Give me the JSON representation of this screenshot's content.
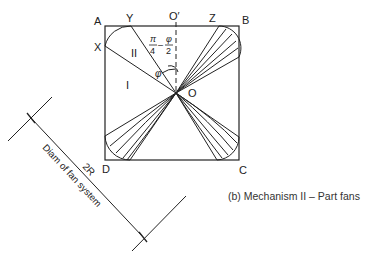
{
  "diagram": {
    "type": "mechanism-sketch",
    "caption": "(b) Mechanism II – Part fans",
    "vertices": {
      "A": "A",
      "B": "B",
      "C": "C",
      "D": "D",
      "X": "X",
      "Y": "Y",
      "Z": "Z",
      "O": "O",
      "O_prime": "O′"
    },
    "regions": {
      "region_1": "I",
      "region_2": "II"
    },
    "angles": {
      "phi": "φ",
      "pi_over_4": "π",
      "pi_over_4_den": "4",
      "minus": "–",
      "phi_over_2": "φ",
      "phi_over_2_den": "2"
    },
    "dimension": {
      "value": "2R",
      "label": "Diam of fan system"
    },
    "colors": {
      "line": "#222222",
      "background": "#ffffff"
    }
  }
}
